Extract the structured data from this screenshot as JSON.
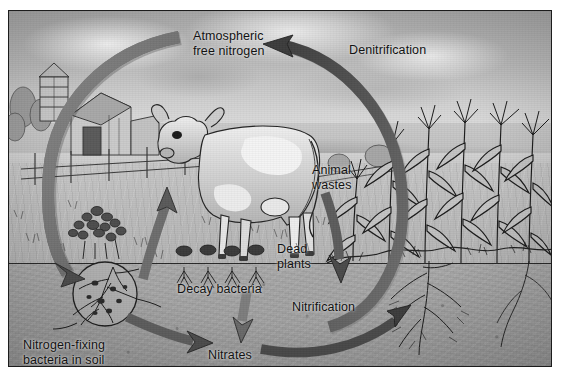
{
  "figure": {
    "style": "grayscale scanned textbook illustration",
    "frame_color": "#1c1c1c",
    "background_color": "#ffffff"
  },
  "labels": [
    {
      "id": "atmospheric-free-nitrogen",
      "text": "Atmospheric\nfree nitrogen",
      "x": 184,
      "y": 18
    },
    {
      "id": "denitrification",
      "text": "Denitrification",
      "x": 340,
      "y": 32
    },
    {
      "id": "animal-wastes",
      "text": "Animal\nwastes",
      "x": 303,
      "y": 152
    },
    {
      "id": "dead-plants",
      "text": "Dead\nplants",
      "x": 268,
      "y": 231
    },
    {
      "id": "decay-bacteria",
      "text": "Decay bacteria",
      "x": 168,
      "y": 271
    },
    {
      "id": "nitrification",
      "text": "Nitrification",
      "x": 283,
      "y": 289
    },
    {
      "id": "nitrates",
      "text": "Nitrates",
      "x": 199,
      "y": 337
    },
    {
      "id": "nitrogen-fixing-bacteria",
      "text": "Nitrogen-fixing\nbacteria in soil",
      "x": 14,
      "y": 327
    }
  ],
  "arrows": [
    {
      "id": "fixation-arc",
      "from": "atmospheric free nitrogen",
      "to": "nitrogen-fixing bacteria in soil",
      "shape": "large-left-arc",
      "color": "#6e6e6e"
    },
    {
      "id": "denitrification-arc",
      "from": "soil nitrates",
      "to": "atmospheric free nitrogen",
      "shape": "large-right-arc",
      "color": "#4f4f4f"
    },
    {
      "id": "uptake-arc",
      "from": "plants",
      "to": "animals",
      "shape": "short-up-arc",
      "color": "#6a6a6a"
    },
    {
      "id": "wastes-arc",
      "from": "animal wastes",
      "to": "soil",
      "shape": "short-down-arc",
      "color": "#5a5a5a"
    },
    {
      "id": "decay-arrow",
      "from": "decay bacteria",
      "to": "nitrates",
      "shape": "down-arrow",
      "color": "#7b7b7b"
    },
    {
      "id": "nodule-arrow",
      "from": "nitrogen-fixing bacteria",
      "to": "nitrates",
      "shape": "right-arc",
      "color": "#5f5f5f"
    },
    {
      "id": "nitrification-arrow",
      "from": "nitrates",
      "to": "plant roots",
      "shape": "right-up-arc",
      "color": "#4a4a4a"
    }
  ],
  "scene_elements": [
    {
      "id": "sky",
      "label": "cloudy sky"
    },
    {
      "id": "silo",
      "label": "farm silo"
    },
    {
      "id": "barn",
      "label": "barn"
    },
    {
      "id": "fence",
      "label": "split-rail fence"
    },
    {
      "id": "cow",
      "label": "dairy cow"
    },
    {
      "id": "lake",
      "label": "lake and distant hills"
    },
    {
      "id": "corn-field",
      "label": "corn field"
    },
    {
      "id": "shrub",
      "label": "legume shrub"
    },
    {
      "id": "dead-plant-stubble",
      "label": "row of dead plant stubble"
    },
    {
      "id": "root-nodule-circle",
      "label": "magnified root nodules with nitrogen-fixing bacteria"
    },
    {
      "id": "corn-roots",
      "label": "corn root system in soil"
    }
  ]
}
